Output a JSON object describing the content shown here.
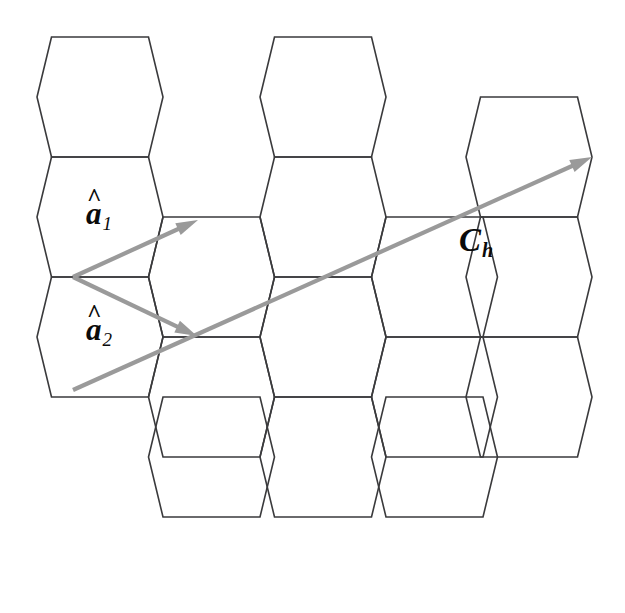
{
  "figure": {
    "background_color": "#ffffff",
    "lattice_line_color": "#3a3a3c",
    "vector_color": "#9a9a9a",
    "label_color": "#0b0b0b",
    "width": 625,
    "height": 613
  },
  "labels": {
    "a1": {
      "base": "a",
      "hat": "^",
      "subscript": "1",
      "text": "â1"
    },
    "a2": {
      "base": "a",
      "hat": "^",
      "subscript": "2",
      "text": "â2"
    },
    "ch": {
      "base": "C",
      "subscript": "h",
      "text": "Ch"
    }
  },
  "chart_data": {
    "type": "diagram",
    "subtype": "hexagonal-lattice-vectors",
    "lattice": {
      "orientation": "flat-top",
      "hex_half_width": 63,
      "hex_half_height": 60,
      "hex_top_edge_half": 48.5,
      "column_step_x": 111.5,
      "row_step_y": 120,
      "row_offset_y": 60,
      "stroke": "#3a3a3c",
      "stroke_width": 1.6,
      "centers": [
        [
          100,
          97
        ],
        [
          211.5,
          157
        ],
        [
          323,
          97
        ],
        [
          434.5,
          157
        ],
        [
          529,
          97
        ],
        [
          100,
          217
        ],
        [
          211.5,
          277
        ],
        [
          323,
          217
        ],
        [
          434.5,
          277
        ],
        [
          529,
          217
        ],
        [
          100,
          337
        ],
        [
          211.5,
          397
        ],
        [
          323,
          337
        ],
        [
          434.5,
          397
        ],
        [
          529,
          337
        ],
        [
          100,
          457
        ],
        [
          211.5,
          517
        ],
        [
          323,
          457
        ],
        [
          434.5,
          517
        ],
        [
          529,
          457
        ]
      ],
      "visible_centers": [
        [
          100,
          97
        ],
        [
          323,
          97
        ],
        [
          529,
          157
        ],
        [
          100,
          217
        ],
        [
          211.5,
          277
        ],
        [
          323,
          217
        ],
        [
          434.5,
          277
        ],
        [
          529,
          277
        ],
        [
          100,
          337
        ],
        [
          211.5,
          397
        ],
        [
          323,
          337
        ],
        [
          434.5,
          397
        ],
        [
          529,
          397
        ],
        [
          211.5,
          457
        ],
        [
          323,
          457
        ],
        [
          434.5,
          457
        ]
      ]
    },
    "vectors": [
      {
        "name": "a1",
        "label": "â1",
        "origin": [
          73,
          277
        ],
        "tip": [
          198,
          220
        ],
        "color": "#9a9a9a",
        "arrowhead": "single",
        "description": "unit vector a-hat-1 pointing up-right to neighboring lattice point"
      },
      {
        "name": "a2",
        "label": "â2",
        "origin": [
          73,
          277
        ],
        "tip": [
          197,
          336
        ],
        "color": "#9a9a9a",
        "arrowhead": "single",
        "description": "unit vector a-hat-2 pointing down-right to neighboring lattice point"
      },
      {
        "name": "Ch",
        "label": "Ch",
        "origin": [
          73,
          390
        ],
        "tip": [
          592,
          157
        ],
        "color": "#9a9a9a",
        "arrowhead": "single",
        "description": "chiral vector C-sub-h spanning the lattice to the upper right"
      }
    ],
    "annotations": [
      {
        "id": "label-a1",
        "text": "â1",
        "x": 86,
        "y": 196
      },
      {
        "id": "label-a2",
        "text": "â2",
        "x": 86,
        "y": 312
      },
      {
        "id": "label-ch",
        "text": "Ch",
        "x": 459,
        "y": 222
      }
    ],
    "xlabel": "",
    "ylabel": "",
    "legend": []
  }
}
